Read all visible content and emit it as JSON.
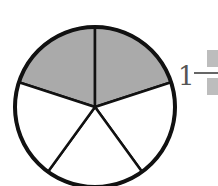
{
  "figure": {
    "type": "fraction-circle",
    "total_parts": 5,
    "shaded_parts": 2,
    "shade_color": "#aaaaaa",
    "outline_color": "#111111",
    "center": [
      95,
      107
    ],
    "radius": 80
  },
  "answer": {
    "whole": "1",
    "numerator": "",
    "denominator": "",
    "placeholder_color": "#bdbdbd"
  }
}
